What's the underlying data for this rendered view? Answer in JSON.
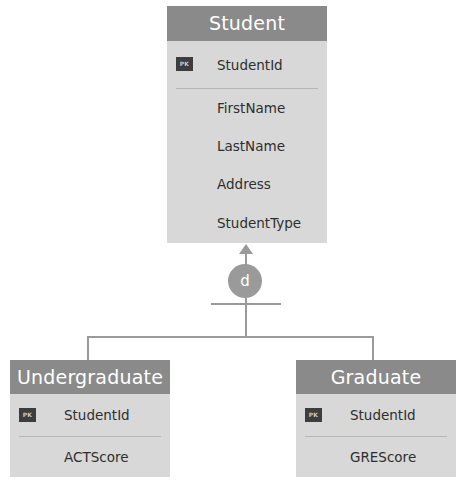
{
  "diagram": {
    "type": "supertype-subtype ER diagram",
    "specialization_symbol": "d",
    "colors": {
      "header_fill": "#8a8a8a",
      "body_fill": "#d8d8d8",
      "pk_badge_fill": "#3d3d3d",
      "connector": "#9a9a9a",
      "header_text": "#ffffff",
      "body_text": "#2e2e2e",
      "divider": "#b6b6b6",
      "background": "#ffffff"
    }
  },
  "entities": {
    "student": {
      "name": "Student",
      "attributes": [
        {
          "label": "StudentId",
          "key": "PK"
        },
        {
          "label": "FirstName",
          "key": ""
        },
        {
          "label": "LastName",
          "key": ""
        },
        {
          "label": "Address",
          "key": ""
        },
        {
          "label": "StudentType",
          "key": ""
        }
      ]
    },
    "undergraduate": {
      "name": "Undergraduate",
      "attributes": [
        {
          "label": "StudentId",
          "key": "PK"
        },
        {
          "label": "ACTScore",
          "key": ""
        }
      ]
    },
    "graduate": {
      "name": "Graduate",
      "attributes": [
        {
          "label": "StudentId",
          "key": "PK"
        },
        {
          "label": "GREScore",
          "key": ""
        }
      ]
    }
  }
}
